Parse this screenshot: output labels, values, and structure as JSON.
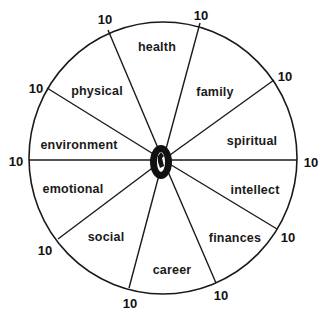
{
  "diagram": {
    "type": "wheel-of-life",
    "center_mark": "0",
    "max_value_label": "10",
    "segments": [
      {
        "label": "health"
      },
      {
        "label": "family"
      },
      {
        "label": "spiritual"
      },
      {
        "label": "intellect"
      },
      {
        "label": "finances"
      },
      {
        "label": "career"
      },
      {
        "label": "social"
      },
      {
        "label": "emotional"
      },
      {
        "label": "environment"
      },
      {
        "label": "physical"
      }
    ],
    "spoke_values": [
      "10",
      "10",
      "10",
      "10",
      "10",
      "10",
      "10",
      "10",
      "10",
      "10"
    ],
    "colors": {
      "line": "#1a1a1a",
      "background": "#ffffff",
      "text": "#1a1a1a"
    }
  }
}
